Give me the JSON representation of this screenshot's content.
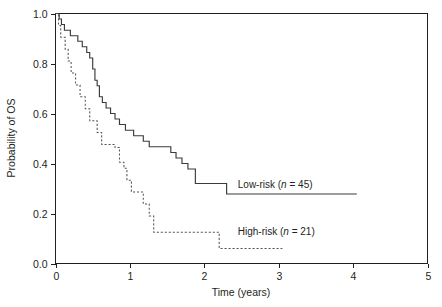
{
  "chart_data": {
    "type": "line",
    "subtype": "kaplan-meier-step",
    "title": "",
    "xlabel": "Time (years)",
    "ylabel": "Probability of OS",
    "xlim": [
      0,
      5
    ],
    "ylim": [
      0,
      1.0
    ],
    "xticks": [
      0,
      1,
      2,
      3,
      4,
      5
    ],
    "xticklabels": [
      "0",
      "1",
      "2",
      "3",
      "4",
      "5"
    ],
    "yticks": [
      0.0,
      0.2,
      0.4,
      0.6,
      0.8,
      1.0
    ],
    "yticklabels": [
      "0.0",
      "0.2",
      "0.4",
      "0.6",
      "0.8",
      "1.0"
    ],
    "grid": false,
    "legend_position": "inline-annotation",
    "series": [
      {
        "name": "Low-risk",
        "n": 45,
        "label_text": "Low-risk (n = 45)",
        "label_prefix": "Low-risk (",
        "label_italic": "n",
        "label_suffix": " = 45)",
        "style": "solid",
        "color": "#3b3b3b",
        "label_x": 2.45,
        "label_y": 0.318,
        "points": [
          [
            0.0,
            1.0
          ],
          [
            0.05,
            1.0
          ],
          [
            0.05,
            0.978
          ],
          [
            0.08,
            0.978
          ],
          [
            0.08,
            0.956
          ],
          [
            0.12,
            0.956
          ],
          [
            0.12,
            0.933
          ],
          [
            0.2,
            0.933
          ],
          [
            0.2,
            0.911
          ],
          [
            0.3,
            0.911
          ],
          [
            0.3,
            0.889
          ],
          [
            0.36,
            0.889
          ],
          [
            0.36,
            0.867
          ],
          [
            0.42,
            0.867
          ],
          [
            0.42,
            0.844
          ],
          [
            0.46,
            0.844
          ],
          [
            0.46,
            0.822
          ],
          [
            0.5,
            0.822
          ],
          [
            0.5,
            0.778
          ],
          [
            0.53,
            0.778
          ],
          [
            0.53,
            0.733
          ],
          [
            0.56,
            0.733
          ],
          [
            0.56,
            0.711
          ],
          [
            0.59,
            0.711
          ],
          [
            0.59,
            0.667
          ],
          [
            0.63,
            0.667
          ],
          [
            0.63,
            0.644
          ],
          [
            0.68,
            0.644
          ],
          [
            0.68,
            0.622
          ],
          [
            0.74,
            0.622
          ],
          [
            0.74,
            0.6
          ],
          [
            0.8,
            0.6
          ],
          [
            0.8,
            0.578
          ],
          [
            0.86,
            0.578
          ],
          [
            0.86,
            0.556
          ],
          [
            0.94,
            0.556
          ],
          [
            0.94,
            0.533
          ],
          [
            1.05,
            0.533
          ],
          [
            1.05,
            0.511
          ],
          [
            1.18,
            0.511
          ],
          [
            1.18,
            0.489
          ],
          [
            1.26,
            0.489
          ],
          [
            1.26,
            0.467
          ],
          [
            1.55,
            0.467
          ],
          [
            1.55,
            0.444
          ],
          [
            1.62,
            0.444
          ],
          [
            1.62,
            0.422
          ],
          [
            1.7,
            0.422
          ],
          [
            1.7,
            0.4
          ],
          [
            1.78,
            0.4
          ],
          [
            1.78,
            0.378
          ],
          [
            1.88,
            0.378
          ],
          [
            1.88,
            0.32
          ],
          [
            2.3,
            0.32
          ],
          [
            2.3,
            0.278
          ],
          [
            4.05,
            0.278
          ]
        ]
      },
      {
        "name": "High-risk",
        "n": 21,
        "label_text": "High-risk (n = 21)",
        "label_prefix": "High-risk (",
        "label_italic": "n",
        "label_suffix": " = 21)",
        "style": "dashed",
        "color": "#565656",
        "label_x": 2.45,
        "label_y": 0.128,
        "points": [
          [
            0.0,
            1.0
          ],
          [
            0.04,
            1.0
          ],
          [
            0.04,
            0.952
          ],
          [
            0.07,
            0.952
          ],
          [
            0.07,
            0.905
          ],
          [
            0.13,
            0.905
          ],
          [
            0.13,
            0.857
          ],
          [
            0.17,
            0.857
          ],
          [
            0.17,
            0.81
          ],
          [
            0.21,
            0.81
          ],
          [
            0.21,
            0.762
          ],
          [
            0.27,
            0.762
          ],
          [
            0.27,
            0.714
          ],
          [
            0.33,
            0.714
          ],
          [
            0.33,
            0.667
          ],
          [
            0.4,
            0.667
          ],
          [
            0.4,
            0.619
          ],
          [
            0.46,
            0.619
          ],
          [
            0.46,
            0.571
          ],
          [
            0.56,
            0.571
          ],
          [
            0.56,
            0.524
          ],
          [
            0.62,
            0.524
          ],
          [
            0.62,
            0.476
          ],
          [
            0.8,
            0.476
          ],
          [
            0.8,
            0.464
          ],
          [
            0.86,
            0.464
          ],
          [
            0.86,
            0.405
          ],
          [
            0.92,
            0.405
          ],
          [
            0.92,
            0.381
          ],
          [
            0.96,
            0.381
          ],
          [
            0.96,
            0.333
          ],
          [
            1.02,
            0.333
          ],
          [
            1.02,
            0.286
          ],
          [
            1.18,
            0.286
          ],
          [
            1.18,
            0.238
          ],
          [
            1.26,
            0.238
          ],
          [
            1.26,
            0.19
          ],
          [
            1.32,
            0.19
          ],
          [
            1.32,
            0.125
          ],
          [
            2.2,
            0.125
          ],
          [
            2.2,
            0.06
          ],
          [
            3.05,
            0.06
          ]
        ]
      }
    ]
  },
  "axes": {
    "y_axis_title": "Probability of OS",
    "x_axis_title": "Time (years)"
  }
}
